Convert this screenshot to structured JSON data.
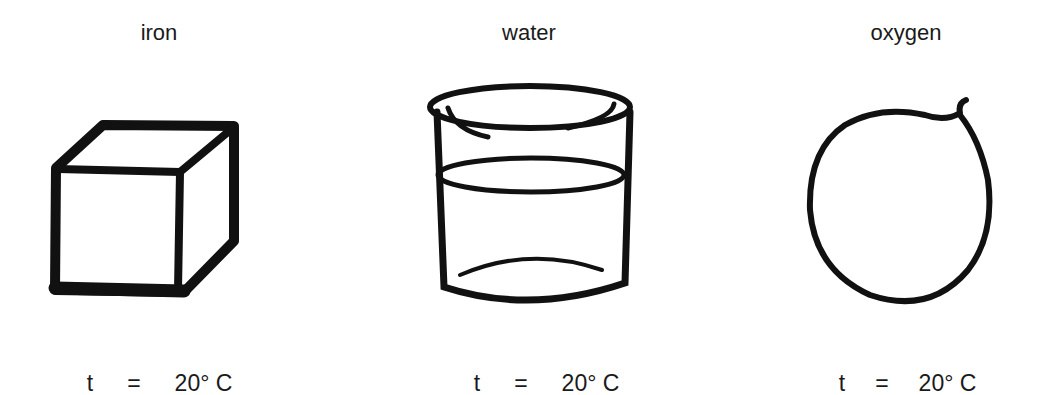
{
  "panels": [
    {
      "name": "iron",
      "state": "solid",
      "icon": "cube-icon",
      "temp_var": "t",
      "temp_eq": "=",
      "temp_value": "20° C"
    },
    {
      "name": "water",
      "state": "liquid",
      "icon": "glass-of-water-icon",
      "temp_var": "t",
      "temp_eq": "=",
      "temp_value": "20° C"
    },
    {
      "name": "oxygen",
      "state": "gas",
      "icon": "balloon-icon",
      "temp_var": "t",
      "temp_eq": "=",
      "temp_value": "20° C"
    }
  ],
  "colors": {
    "ink": "#111111",
    "background": "#ffffff"
  }
}
